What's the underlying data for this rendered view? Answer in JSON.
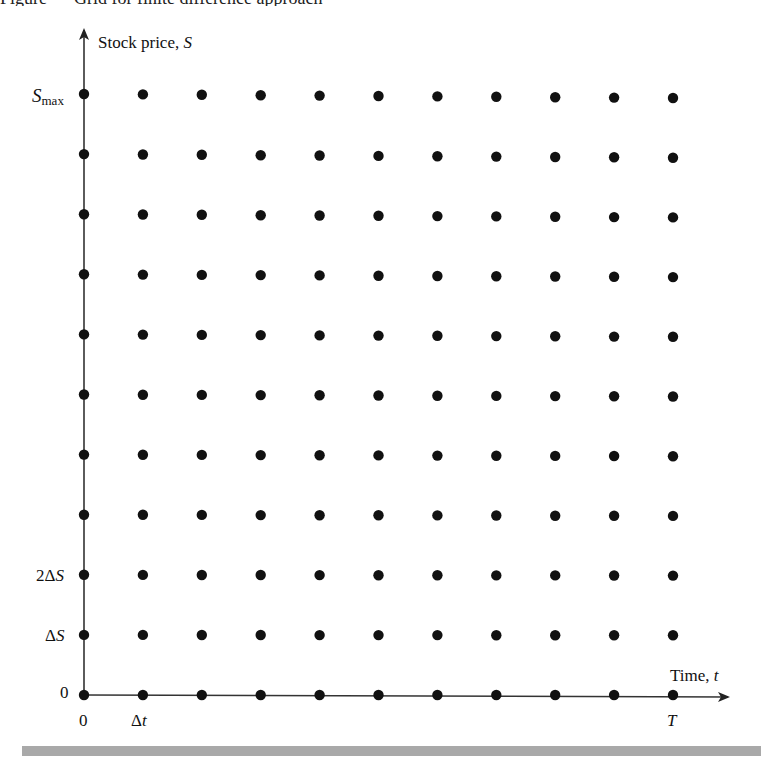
{
  "caption_fragment": "Figure — Grid for finite difference approach",
  "y_axis": {
    "label_text": "Stock price, ",
    "label_var": "S",
    "ticks": [
      {
        "name": "s-max",
        "var": "S",
        "sub": "max"
      },
      {
        "name": "two-delta-s",
        "prefix": "2Δ",
        "var": "S"
      },
      {
        "name": "delta-s",
        "prefix": "Δ",
        "var": "S"
      },
      {
        "name": "zero",
        "text": "0"
      }
    ]
  },
  "x_axis": {
    "label_text": "Time, ",
    "label_var": "t",
    "ticks": [
      {
        "name": "zero",
        "text": "0"
      },
      {
        "name": "delta-t",
        "prefix": "Δ",
        "var": "t"
      },
      {
        "name": "T",
        "var": "T"
      }
    ]
  },
  "grid": {
    "columns": 11,
    "rows": 11,
    "dot_color": "#111111",
    "axis_color": "#333333",
    "bar_color": "#a9a9a9"
  },
  "chart_data": {
    "type": "scatter",
    "title": "Grid for finite difference approach",
    "xlabel": "Time, t",
    "ylabel": "Stock price, S",
    "x_ticks": [
      "0",
      "Δt",
      "T"
    ],
    "y_ticks": [
      "0",
      "ΔS",
      "2ΔS",
      "S_max"
    ],
    "x_index": [
      0,
      1,
      2,
      3,
      4,
      5,
      6,
      7,
      8,
      9,
      10
    ],
    "y_index": [
      0,
      1,
      2,
      3,
      4,
      5,
      6,
      7,
      8,
      9,
      10
    ]
  }
}
